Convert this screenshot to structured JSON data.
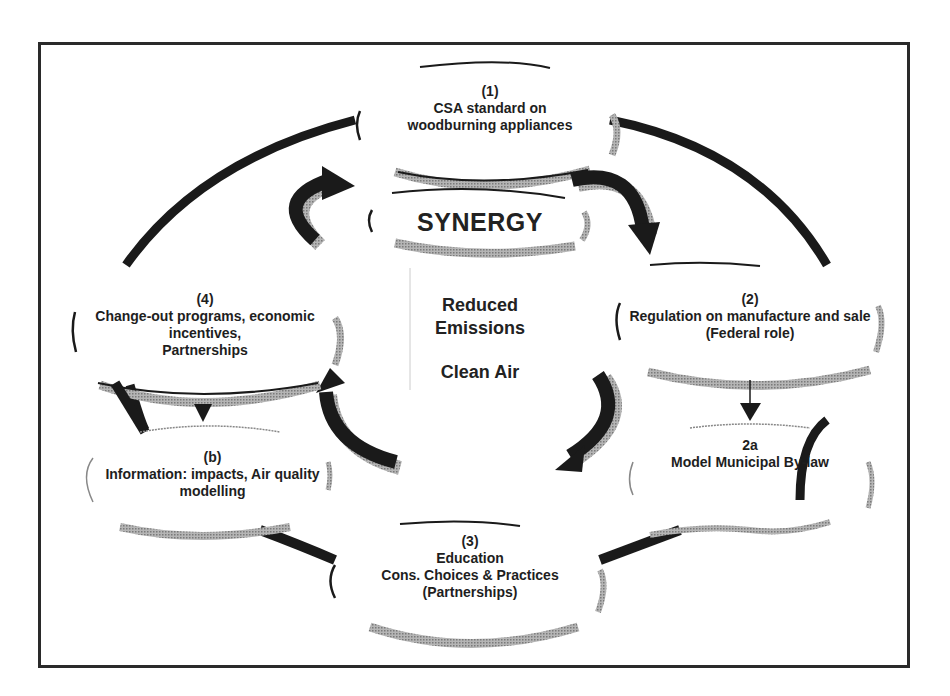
{
  "diagram": {
    "center": {
      "synergy": "SYNERGY",
      "outcome_lines": [
        "Reduced",
        "Emissions"
      ],
      "outcome_2": "Clean Air"
    },
    "nodes": [
      {
        "id": "1",
        "lines": [
          "(1)",
          "CSA standard on",
          "woodburning appliances"
        ]
      },
      {
        "id": "2",
        "lines": [
          "(2)",
          "Regulation on manufacture and sale",
          "(Federal role)"
        ]
      },
      {
        "id": "2a",
        "lines": [
          "2a",
          "Model Municipal By-law"
        ]
      },
      {
        "id": "3",
        "lines": [
          "(3)",
          "Education",
          "Cons. Choices & Practices",
          "(Partnerships)"
        ]
      },
      {
        "id": "4",
        "lines": [
          "(4)",
          "Change-out programs, economic",
          "incentives,",
          "Partnerships"
        ]
      },
      {
        "id": "b",
        "lines": [
          "(b)",
          "Information: impacts, Air quality",
          "modelling"
        ]
      }
    ],
    "edges": [
      {
        "from": "1",
        "to": "2",
        "type": "curved-arrow"
      },
      {
        "from": "2",
        "to": "3",
        "type": "curved-arrow"
      },
      {
        "from": "3",
        "to": "4",
        "type": "curved-arrow"
      },
      {
        "from": "4",
        "to": "1",
        "type": "curved-arrow"
      },
      {
        "from": "2",
        "to": "2a",
        "type": "down-arrow"
      },
      {
        "from": "4",
        "to": "b",
        "type": "down-arrow"
      }
    ],
    "colors": {
      "ink": "#1a1a1a",
      "shadow": "#9a9a9a",
      "frame": "#2a2a2a",
      "background": "#ffffff"
    }
  }
}
